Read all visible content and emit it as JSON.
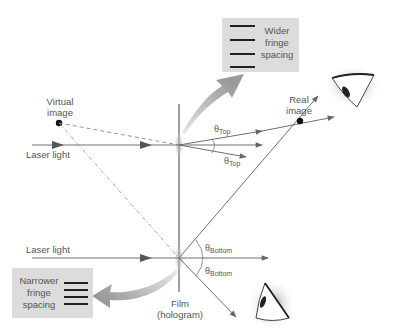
{
  "labels": {
    "virtual_image": "Virtual image",
    "virtual_image_line1": "Virtual",
    "virtual_image_line2": "image",
    "real_image_line1": "Real",
    "real_image_line2": "image",
    "laser_light_top": "Laser light",
    "laser_light_bottom": "Laser light",
    "film_line1": "Film",
    "film_line2": "(hologram)"
  },
  "angles": {
    "theta_symbol": "θ",
    "top_sub": "Top",
    "bottom_sub": "Bottom"
  },
  "boxes": {
    "wider": {
      "line1": "Wider",
      "line2": "fringe",
      "line3": "spacing",
      "fringe_count": 4
    },
    "narrower": {
      "line1": "Narrower",
      "line2": "fringe",
      "line3": "spacing",
      "fringe_count": 4
    }
  },
  "icons": {
    "eye_top": "eye-icon",
    "eye_bottom": "eye-icon"
  },
  "colors": {
    "line": "#6e6e6e",
    "box_fill": "#dcdcdc",
    "fringe": "#222222",
    "curved_arrow": "#a8a8a8",
    "point": "#111111"
  }
}
